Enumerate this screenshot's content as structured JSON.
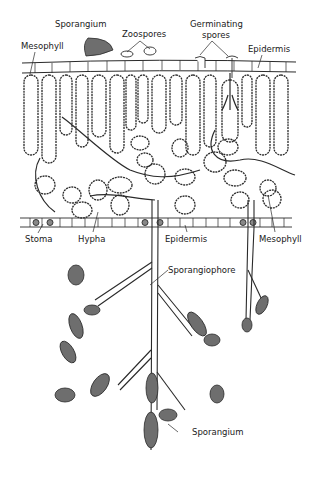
{
  "diagram": {
    "labels": {
      "sporangium_top": "Sporangium",
      "zoospores": "Zoospores",
      "germinating_spores_line1": "Germinating",
      "germinating_spores_line2": "spores",
      "mesophyll_top": "Mesophyll",
      "epidermis_top": "Epidermis",
      "stoma": "Stoma",
      "hypha": "Hypha",
      "epidermis_bottom": "Epidermis",
      "mesophyll_bottom": "Mesophyll",
      "sporangiophore": "Sporangiophore",
      "sporangium_bottom": "Sporangium"
    },
    "colors": {
      "line": "#2a2a2a",
      "sporangium_fill": "#6e6e6e",
      "cell_fill": "#ffffff",
      "background": "#ffffff"
    }
  }
}
